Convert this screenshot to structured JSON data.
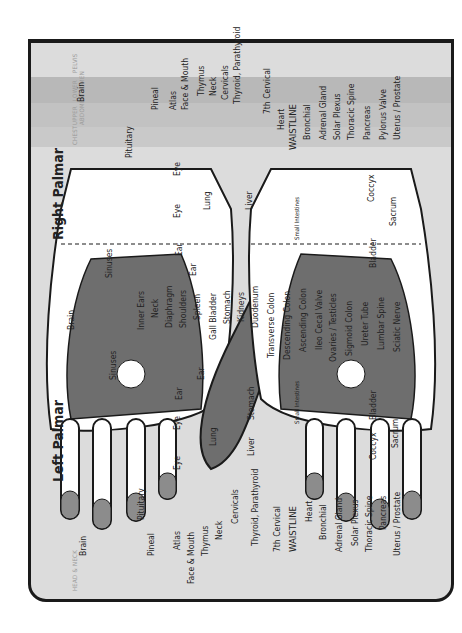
{
  "chart": {
    "title_left": "Left Palmar",
    "title_right": "Right Palmar",
    "bands": [
      {
        "label": "HEAD & NECK"
      },
      {
        "label": "CHEST"
      },
      {
        "label": "UPPER ABDOMEN"
      },
      {
        "label": "LOWER ABDOMEN"
      },
      {
        "label": "PELVIS"
      }
    ],
    "waistline_label": "WAISTLINE",
    "colors": {
      "background": "#dcdcdc",
      "band_chest": "#c8c8c8",
      "band_lower": "#bdbdbd",
      "hand_dark": "#6e6e6e",
      "hand_mid": "#8c8c8c",
      "hand_light": "#ffffff",
      "outline": "#1a1a1a"
    },
    "left_hand": {
      "outer_labels": [
        "Brain",
        "Pineal",
        "Atlas",
        "Face & Mouth",
        "Thymus",
        "Neck",
        "Cervicals",
        "Thyroid, Parathyroid",
        "7th Cervical",
        "Heart",
        "Bronchial",
        "Adrenal Gland",
        "Solar Plexus",
        "Thoracic Spine",
        "Pancreas",
        "Uterus / Prostate",
        "Pituitary",
        "Sinuses"
      ],
      "inner_labels": [
        "Eye",
        "Eye",
        "Ear",
        "Ear",
        "Lung",
        "Liver",
        "Stomach",
        "Small Intestines"
      ],
      "bottom_labels": [
        "Coccyx",
        "Bladder",
        "Sacrum"
      ]
    },
    "right_hand": {
      "outer_labels": [
        "Brain",
        "Pineal",
        "Atlas",
        "Face & Mouth",
        "Thymus",
        "Neck",
        "Cervicals",
        "Thyroid, Parathyroid",
        "7th Cervical",
        "Heart",
        "Bronchial",
        "Adrenal Gland",
        "Solar Plexus",
        "Thoracic Spine",
        "Pancreas",
        "Pylorus Valve",
        "Uterus / Prostate",
        "Pituitary",
        "Sinuses"
      ],
      "inner_labels": [
        "Eye",
        "Eye",
        "Ear",
        "Ear",
        "Lung",
        "Liver",
        "Small Intestines"
      ],
      "bottom_labels": [
        "Coccyx",
        "Bladder",
        "Sacrum"
      ]
    },
    "center_labels": [
      "Inner Ears",
      "Neck",
      "Diaphragm",
      "Shoulders",
      "Spleen",
      "Gall Bladder",
      "Stomach",
      "Kidneys",
      "Duodenum",
      "Transverse Colon",
      "Descending Colon",
      "Ascending Colon",
      "Ileo Cecal Valve",
      "Ovaries / Testicles",
      "Sigmoid Colon",
      "Ureter Tube",
      "Lumbar Spine",
      "Sciatic Nerve"
    ]
  }
}
